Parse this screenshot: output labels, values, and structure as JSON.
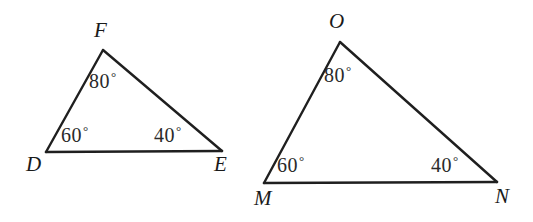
{
  "figure": {
    "kind": "geometry-diagram",
    "background_color": "#ffffff",
    "stroke_color": "#1f1f1f",
    "text_color": "#1a1a1a",
    "degree_symbol": "°"
  },
  "triangles": [
    {
      "id": "triangle-def",
      "name": "Triangle DEF",
      "vertices": [
        {
          "id": "vertex-d",
          "label": "D",
          "x": 46,
          "y": 152,
          "label_x": 26,
          "label_y": 154
        },
        {
          "id": "vertex-e",
          "label": "E",
          "x": 222,
          "y": 151,
          "label_x": 214,
          "label_y": 154
        },
        {
          "id": "vertex-f",
          "label": "F",
          "x": 103,
          "y": 50,
          "label_x": 94,
          "label_y": 20
        }
      ],
      "angles": [
        {
          "id": "angle-f",
          "at_vertex": "F",
          "value": 80,
          "text": "80",
          "unit": "°",
          "label_x": 89,
          "label_y": 70
        },
        {
          "id": "angle-d",
          "at_vertex": "D",
          "value": 60,
          "text": "60",
          "unit": "°",
          "label_x": 61,
          "label_y": 124
        },
        {
          "id": "angle-e",
          "at_vertex": "E",
          "value": 40,
          "text": "40",
          "unit": "°",
          "label_x": 154,
          "label_y": 124
        }
      ],
      "sides": [
        {
          "id": "side-df",
          "from": "D",
          "to": "F"
        },
        {
          "id": "side-fe",
          "from": "F",
          "to": "E"
        },
        {
          "id": "side-de",
          "from": "D",
          "to": "E"
        }
      ]
    },
    {
      "id": "triangle-mno",
      "name": "Triangle MNO",
      "vertices": [
        {
          "id": "vertex-m",
          "label": "M",
          "x": 264,
          "y": 183,
          "label_x": 254,
          "label_y": 188
        },
        {
          "id": "vertex-n",
          "label": "N",
          "x": 497,
          "y": 182,
          "label_x": 495,
          "label_y": 186
        },
        {
          "id": "vertex-o",
          "label": "O",
          "x": 340,
          "y": 42,
          "label_x": 329,
          "label_y": 11
        }
      ],
      "angles": [
        {
          "id": "angle-o",
          "at_vertex": "O",
          "value": 80,
          "text": "80",
          "unit": "°",
          "label_x": 324,
          "label_y": 64
        },
        {
          "id": "angle-m",
          "at_vertex": "M",
          "value": 60,
          "text": "60",
          "unit": "°",
          "label_x": 277,
          "label_y": 154
        },
        {
          "id": "angle-n",
          "at_vertex": "N",
          "value": 40,
          "text": "40",
          "unit": "°",
          "label_x": 431,
          "label_y": 154
        }
      ],
      "sides": [
        {
          "id": "side-mo",
          "from": "M",
          "to": "O"
        },
        {
          "id": "side-on",
          "from": "O",
          "to": "N"
        },
        {
          "id": "side-mn",
          "from": "M",
          "to": "N"
        }
      ]
    }
  ],
  "labels": {
    "left": {
      "vertex_f": "F",
      "vertex_d": "D",
      "vertex_e": "E",
      "angle_f": "80",
      "angle_d": "60",
      "angle_e": "40"
    },
    "right": {
      "vertex_o": "O",
      "vertex_m": "M",
      "vertex_n": "N",
      "angle_o": "80",
      "angle_m": "60",
      "angle_n": "40"
    },
    "degree": "°"
  }
}
